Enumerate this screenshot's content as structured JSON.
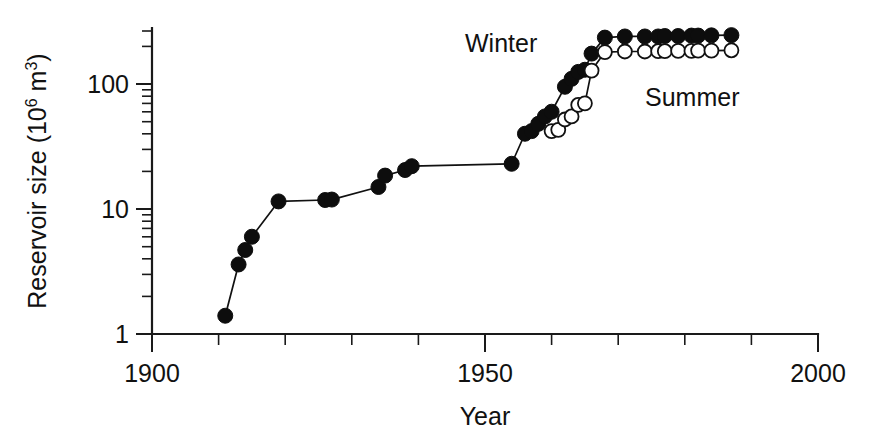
{
  "chart_data": {
    "type": "line",
    "title": "",
    "xlabel": "Year",
    "ylabel": "Reservoir size (10⁶ m³)",
    "ylabel_base": "Reservoir size (10",
    "ylabel_exp": "6",
    "ylabel_tail": " m",
    "ylabel_exp2": "3",
    "ylabel_close": ")",
    "xlim": [
      1900,
      2000
    ],
    "ylim": [
      1,
      300
    ],
    "yscale": "log",
    "xscale": "linear",
    "grid": false,
    "legend_position": "inline-annotations",
    "xticks": [
      1900,
      1950,
      2000
    ],
    "xtick_labels": [
      "1900",
      "1950",
      "2000"
    ],
    "xminor_ticks": [
      1910,
      1920,
      1930,
      1940,
      1960,
      1970,
      1980,
      1990
    ],
    "yticks": [
      1,
      10,
      100
    ],
    "ytick_labels": [
      "1",
      "10",
      "100"
    ],
    "yminor_ticks": [
      2,
      3,
      4,
      5,
      6,
      7,
      8,
      9,
      20,
      30,
      40,
      50,
      60,
      70,
      80,
      90,
      200,
      300
    ],
    "annotations": [
      {
        "text": "Winter",
        "x": 1950,
        "y": 250
      },
      {
        "text": "Summer",
        "x": 1972,
        "y": 105
      }
    ],
    "series": [
      {
        "name": "Winter",
        "marker": "filled-circle",
        "x": [
          1911,
          1913,
          1914,
          1915,
          1919,
          1926,
          1927,
          1934,
          1935,
          1938,
          1939,
          1954,
          1956,
          1957,
          1958,
          1959,
          1960,
          1962,
          1963,
          1964,
          1965,
          1966,
          1968,
          1971,
          1974,
          1976,
          1977,
          1979,
          1981,
          1982,
          1984,
          1987
        ],
        "values": [
          1.4,
          3.6,
          4.7,
          6.0,
          11.5,
          11.8,
          11.9,
          15.0,
          18.5,
          20.5,
          22.0,
          23.0,
          40.0,
          42.0,
          48.0,
          55.0,
          60.0,
          95.0,
          110.0,
          125.0,
          130.0,
          175.0,
          235.0,
          240.0,
          240.0,
          240.0,
          242.0,
          242.0,
          244.0,
          244.0,
          245.0,
          246.0
        ]
      },
      {
        "name": "Summer",
        "marker": "open-circle",
        "x": [
          1960,
          1961,
          1962,
          1963,
          1964,
          1965,
          1966,
          1968,
          1971,
          1974,
          1976,
          1977,
          1979,
          1981,
          1982,
          1984,
          1987
        ],
        "values": [
          42.0,
          43.0,
          52.0,
          55.0,
          68.0,
          70.0,
          128.0,
          180.0,
          182.0,
          182.0,
          183.0,
          183.0,
          184.0,
          184.0,
          185.0,
          185.0,
          186.0
        ]
      }
    ]
  },
  "axis": {
    "x_title": "Year",
    "x_tick_1900": "1900",
    "x_tick_1950": "1950",
    "x_tick_2000": "2000",
    "y_tick_1": "1",
    "y_tick_10": "10",
    "y_tick_100": "100",
    "y_title_part1": "Reservoir size (10",
    "y_title_exp1": "6",
    "y_title_part2": " m",
    "y_title_exp2": "3",
    "y_title_part3": ")"
  },
  "labels": {
    "winter": "Winter",
    "summer": "Summer"
  },
  "colors": {
    "foreground": "#111111",
    "background": "#ffffff",
    "winter_marker": "#0d0d0d",
    "summer_marker": "#ffffff"
  }
}
